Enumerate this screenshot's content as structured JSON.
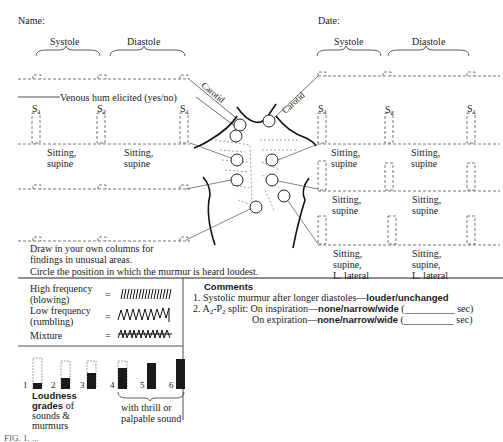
{
  "header": {
    "name_label": "Name:",
    "date_label": "Date:"
  },
  "phase_labels": {
    "left_systole": "Systole",
    "left_diastole": "Diastole",
    "right_systole": "Systole",
    "right_diastole": "Diastole"
  },
  "venous_hum": "Venous hum elicited (yes/no)",
  "heart_sounds": {
    "s1": "S",
    "s2": "S",
    "sub1": "1",
    "sub2": "2"
  },
  "carotid_label": "Carotid",
  "positions": {
    "left_row1_a": "Sitting,\nsupine",
    "left_row1_b": "Sitting,\nsupine",
    "right_row1_a": "Sitting,\nsupine",
    "right_row1_b": "Sitting,\nsupine",
    "right_row2_a": "Sitting,\nsupine",
    "right_row2_b": "Sitting,\nsupine",
    "right_row3_a": "Sitting,\nsupine,\nL. lateral",
    "right_row3_b": "Sitting,\nsupine,\nL. lateral"
  },
  "instructions": {
    "draw_own": "Draw in your own columns for\nfindings in unusual areas.",
    "circle_loudest": "Circle the position in which the murmur is heard loudest."
  },
  "legend_frequency": [
    {
      "label": "High frequency\n(blowing)",
      "equals": "="
    },
    {
      "label": "Low frequency\n(rumbling)",
      "equals": "="
    },
    {
      "label": "Mixture",
      "equals": "="
    }
  ],
  "loudness": {
    "grades": [
      "1",
      "2",
      "3",
      "4",
      "5",
      "6"
    ],
    "title_bold_1": "Loudness",
    "title_bold_2": "grades",
    "title_rest_1": " of",
    "title_rest_2": "sounds &",
    "title_rest_3": "murmurs",
    "thrill_note": "with thrill or\npalpable sound"
  },
  "comments": {
    "title": "Comments",
    "item1_num": "1.",
    "item1_text": "Systolic murmur after longer diastoles—",
    "item1_options": "louder/unchanged",
    "item2_num": "2.",
    "item2_prefix": "A",
    "item2_sub_a": "2",
    "item2_mid": "-P",
    "item2_sub_p": "2",
    "item2_split": " split: On inspiration—",
    "item2_options": "none/narrow/wide",
    "item2_blank": " (__________ sec)",
    "item3_text": "On expiration—",
    "item3_options": "none/narrow/wide",
    "item3_blank": " (__________ sec)"
  },
  "caption_fragment": "FIG. 1. ..."
}
